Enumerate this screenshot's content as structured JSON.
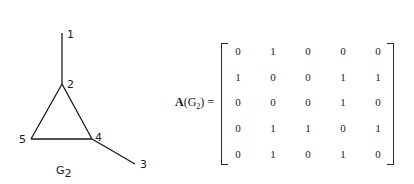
{
  "graph": {
    "caption": "G",
    "caption_subscript": "2",
    "vertices": [
      {
        "id": "1",
        "x": 62,
        "y": 33,
        "label_x": 67,
        "label_y": 38
      },
      {
        "id": "2",
        "x": 62,
        "y": 84,
        "label_x": 67,
        "label_y": 88
      },
      {
        "id": "3",
        "x": 135,
        "y": 164,
        "label_x": 140,
        "label_y": 168
      },
      {
        "id": "4",
        "x": 92,
        "y": 139,
        "label_x": 95,
        "label_y": 141
      },
      {
        "id": "5",
        "x": 31,
        "y": 139,
        "label_x": 19,
        "label_y": 143
      }
    ],
    "edges": [
      [
        "1",
        "2"
      ],
      [
        "2",
        "4"
      ],
      [
        "2",
        "5"
      ],
      [
        "4",
        "5"
      ],
      [
        "4",
        "3"
      ]
    ]
  },
  "matrix": {
    "label_main": "A",
    "label_open": "(G",
    "label_sub": "2",
    "label_close": ") =",
    "rows": [
      [
        "0",
        "1",
        "0",
        "0",
        "0"
      ],
      [
        "1",
        "0",
        "0",
        "1",
        "1"
      ],
      [
        "0",
        "0",
        "0",
        "1",
        "0"
      ],
      [
        "0",
        "1",
        "1",
        "0",
        "1"
      ],
      [
        "0",
        "1",
        "0",
        "1",
        "0"
      ]
    ]
  }
}
